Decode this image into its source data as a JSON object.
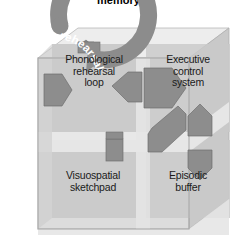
{
  "figure": {
    "title": "memory",
    "type": "working-memory-model-cube-diagram",
    "background_color": "#ffffff"
  },
  "loop": {
    "label": "Maintenance rehearsal",
    "color": "#8c8c8c",
    "shape": "circular-arrow"
  },
  "cube": {
    "front_face_color": "#d2d2d2",
    "top_face_color": "#ececec",
    "side_face_color": "#c4c4c4",
    "quadrant_color": "#c6c6c6",
    "outline_color": "#9a9a9a"
  },
  "components": [
    {
      "id": "phonological-rehearsal-loop",
      "label": "Phonological\nrehearsal\nloop",
      "position": "top-left"
    },
    {
      "id": "executive-control-system",
      "label": "Executive\ncontrol\nsystem",
      "position": "top-right"
    },
    {
      "id": "visuospatial-sketchpad",
      "label": "Visuospatial\nsketchpad",
      "position": "bottom-left"
    },
    {
      "id": "episodic-buffer",
      "label": "Episodic\nbuffer",
      "position": "bottom-right"
    }
  ],
  "arrows": {
    "color": "#8a8a8a",
    "stroke": "#6f6f6f",
    "items": [
      {
        "id": "arrow-into-phonological-loop",
        "direction": "right"
      },
      {
        "id": "arrow-phonological-to-executive-up",
        "direction": "up"
      },
      {
        "id": "arrow-executive-to-phonological-left",
        "direction": "left"
      },
      {
        "id": "arrow-executive-to-visuospatial-diagonal",
        "direction": "down-left"
      },
      {
        "id": "arrow-executive-to-episodic-down",
        "direction": "down"
      },
      {
        "id": "arrow-phonological-to-executive-right",
        "direction": "right"
      },
      {
        "id": "arrow-visuospatial-up",
        "direction": "up"
      },
      {
        "id": "arrow-episodic-down",
        "direction": "down"
      }
    ]
  }
}
